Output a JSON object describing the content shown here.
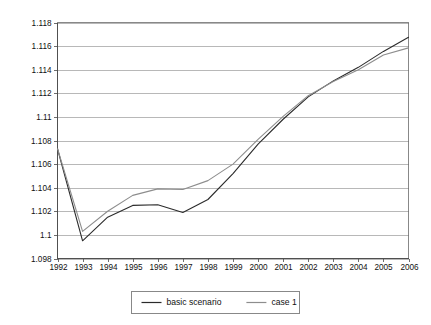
{
  "chart_data": {
    "type": "line",
    "title": "",
    "xlabel": "",
    "ylabel": "",
    "grid": true,
    "legend_position": "bottom",
    "categories": [
      "1992",
      "1993",
      "1994",
      "1995",
      "1996",
      "1997",
      "1998",
      "1999",
      "2000",
      "2001",
      "2002",
      "2003",
      "2004",
      "2005",
      "2006"
    ],
    "x": [
      1992,
      1993,
      1994,
      1995,
      1996,
      1997,
      1998,
      1999,
      2000,
      2001,
      2002,
      2003,
      2004,
      2005,
      2006
    ],
    "xlim": [
      1992,
      2006
    ],
    "ylim": [
      1.098,
      1.118
    ],
    "ytick_labels": [
      "1.118",
      "1.116",
      "1.114",
      "1.112",
      "1.11",
      "1.108",
      "1.106",
      "1.104",
      "1.102",
      "1.1",
      "1.098"
    ],
    "ytick_values": [
      1.118,
      1.116,
      1.114,
      1.112,
      1.11,
      1.108,
      1.106,
      1.104,
      1.102,
      1.1,
      1.098
    ],
    "ytick_step": 0.002,
    "series": [
      {
        "name": "basic scenario",
        "color": "#2b2b2b",
        "values": [
          1.1073,
          1.0995,
          1.1015,
          1.1025,
          1.10255,
          1.1019,
          1.103,
          1.1052,
          1.1077,
          1.1098,
          1.1117,
          1.11305,
          1.1142,
          1.11555,
          1.11675
        ]
      },
      {
        "name": "case 1",
        "color": "#8d8d8d",
        "values": [
          1.1073,
          1.1003,
          1.102,
          1.10335,
          1.1039,
          1.10385,
          1.1046,
          1.106,
          1.1081,
          1.11005,
          1.1118,
          1.113,
          1.114,
          1.11525,
          1.11585
        ]
      }
    ]
  },
  "legend": {
    "entries": [
      {
        "label": "basic scenario"
      },
      {
        "label": "case 1"
      }
    ]
  },
  "colors": {
    "basic_scenario": "#2b2b2b",
    "case_1": "#8d8d8d",
    "gridline": "#9a9a9a",
    "axis": "#4a4a4a",
    "background": "#ffffff"
  }
}
